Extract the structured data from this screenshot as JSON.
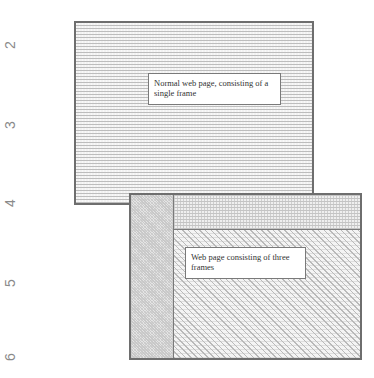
{
  "ruler": {
    "numbers": [
      "2",
      "3",
      "4",
      "5",
      "6"
    ]
  },
  "single_frame_page": {
    "label": "Normal web page, consisting of a single frame",
    "pattern": "horizontal-stripes"
  },
  "three_frame_page": {
    "label": "Web page consisting of three frames",
    "frames": [
      {
        "name": "left-frame",
        "pattern": "dots"
      },
      {
        "name": "top-frame",
        "pattern": "grid"
      },
      {
        "name": "main-frame",
        "pattern": "diagonal-hatch"
      }
    ]
  },
  "colors": {
    "border": "#6e6e6e",
    "ruler_text": "#8a8a8a",
    "label_bg": "#ffffff"
  }
}
